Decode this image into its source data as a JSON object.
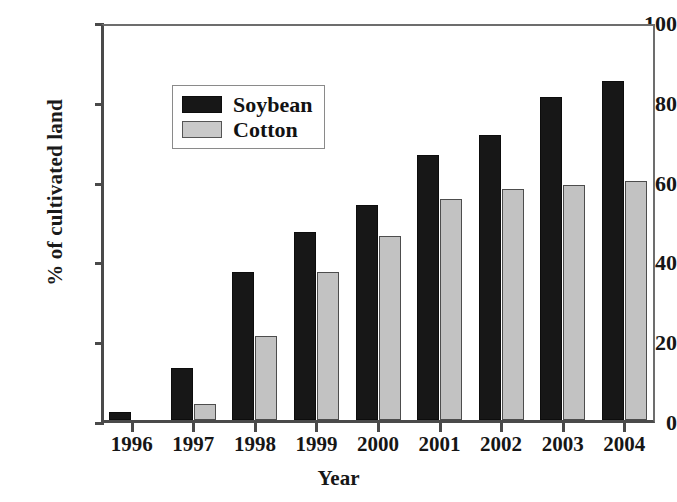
{
  "chart_data": {
    "type": "bar",
    "title": "",
    "xlabel": "Year",
    "ylabel": "% of cultivated land",
    "categories": [
      "1996",
      "1997",
      "1998",
      "1999",
      "2000",
      "2001",
      "2002",
      "2003",
      "2004"
    ],
    "series": [
      {
        "name": "Soybean",
        "color": "#171717",
        "values": [
          2,
          13,
          37,
          47,
          54,
          66.5,
          71.5,
          81,
          85
        ]
      },
      {
        "name": "Cotton",
        "color": "#c2c2c2",
        "values": [
          0,
          4,
          21,
          37,
          46,
          55.5,
          58,
          59,
          60
        ]
      }
    ],
    "ylim": [
      0,
      100
    ],
    "yticks": [
      "0",
      "20",
      "40",
      "60",
      "80",
      "100"
    ],
    "grid": false,
    "legend_position": "upper-left-inside"
  },
  "legend": {
    "items": [
      {
        "label": "Soybean",
        "swatch": "soybean"
      },
      {
        "label": "Cotton",
        "swatch": "cotton"
      }
    ]
  }
}
